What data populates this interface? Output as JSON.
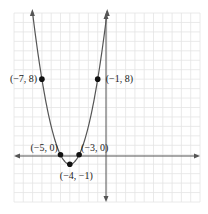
{
  "chart_data": {
    "type": "line",
    "title": "",
    "xlabel": "",
    "ylabel": "",
    "function": "y = (x + 4)^2 - 1",
    "xlim": [
      -10,
      10
    ],
    "ylim": [
      -5,
      15
    ],
    "grid": true,
    "legend": null,
    "points": [
      {
        "x": -7,
        "y": 8,
        "label": "(−7, 8)"
      },
      {
        "x": -1,
        "y": 8,
        "label": "(−1, 8)"
      },
      {
        "x": -5,
        "y": 0,
        "label": "(−5, 0)"
      },
      {
        "x": -3,
        "y": 0,
        "label": "(−3, 0)"
      },
      {
        "x": -4,
        "y": -1,
        "label": "(−4, −1)"
      }
    ]
  },
  "colors": {
    "grid": "#e4e4e4",
    "axis": "#555555",
    "curve": "#555555",
    "point": "#111111"
  }
}
